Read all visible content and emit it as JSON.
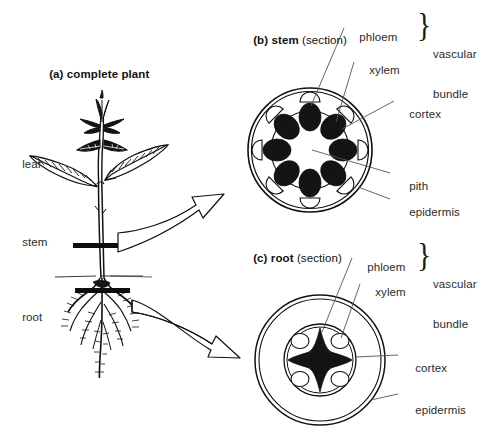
{
  "figure": {
    "title_a": "(a) complete plant",
    "panels": [
      {
        "id": "a",
        "prefix": "(a)",
        "bold_part": "complete plant",
        "suffix": ""
      },
      {
        "id": "b",
        "prefix": "(b)",
        "bold_part": "stem",
        "suffix": "(section)"
      },
      {
        "id": "c",
        "prefix": "(c)",
        "bold_part": "root",
        "suffix": "(section)"
      }
    ]
  },
  "panel_a": {
    "heading": "(a) complete plant",
    "heading_prefix": "(a)",
    "heading_bold": "complete plant",
    "labels": {
      "leaf": "leaf",
      "stem": "stem",
      "root": "root"
    }
  },
  "panel_b": {
    "heading_prefix": "(b)",
    "heading_bold": "stem",
    "heading_suffix": "(section)",
    "labels": {
      "phloem": "phloem",
      "xylem": "xylem",
      "cortex": "cortex",
      "pith": "pith",
      "epidermis": "epidermis"
    },
    "brace_label_line1": "vascular",
    "brace_label_line2": "bundle",
    "brace_glyph": "}",
    "structure": {
      "vascular_bundle_count": 8,
      "xylem_fill": "#141414",
      "phloem_fill": "#ffffff",
      "epidermis_stroke": "#111111",
      "cortex_stroke": "#111111"
    }
  },
  "panel_c": {
    "heading_prefix": "(c)",
    "heading_bold": "root",
    "heading_suffix": "(section)",
    "labels": {
      "phloem": "phloem",
      "xylem": "xylem",
      "cortex": "cortex",
      "epidermis": "epidermis"
    },
    "brace_label_line1": "vascular",
    "brace_label_line2": "bundle",
    "brace_glyph": "}",
    "structure": {
      "xylem_arms": 4,
      "phloem_count": 4,
      "xylem_fill": "#141414",
      "phloem_fill": "#ffffff"
    }
  },
  "colors": {
    "background": "#ffffff",
    "ink": "#111111",
    "text": "#2b2b2b",
    "fill_dark": "#141414"
  },
  "icons": {
    "arrow_stem": "arrow-to-stem-section",
    "arrow_root": "arrow-to-root-section",
    "section_marker_stem": "stem-section-marker",
    "section_marker_root": "root-section-marker",
    "soil_line": "soil-line"
  }
}
